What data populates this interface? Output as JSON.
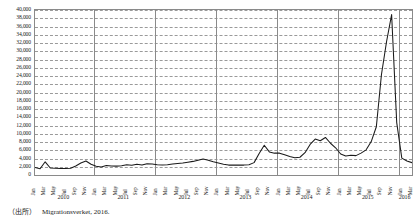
{
  "chart_data": {
    "type": "line",
    "title": "",
    "subtitle": "",
    "xlabel": "",
    "ylabel": "",
    "ylim": [
      0,
      40000
    ],
    "ytick_step": 2000,
    "yticks": [
      "0",
      "2,000",
      "4,000",
      "6,000",
      "8,000",
      "10,000",
      "12,000",
      "14,000",
      "16,000",
      "18,000",
      "20,000",
      "22,000",
      "24,000",
      "26,000",
      "28,000",
      "30,000",
      "32,000",
      "34,000",
      "36,000",
      "38,000",
      "40,000"
    ],
    "grid": true,
    "legend": "none",
    "x_tick_months": [
      "Jan",
      "Mar",
      "May",
      "Jul",
      "Sep",
      "Nov"
    ],
    "years": [
      "2010",
      "2011",
      "2012",
      "2013",
      "2014",
      "2015",
      "2016"
    ],
    "months_per_year": [
      12,
      12,
      12,
      12,
      12,
      12,
      3
    ],
    "x": [
      "2010-01",
      "2010-02",
      "2010-03",
      "2010-04",
      "2010-05",
      "2010-06",
      "2010-07",
      "2010-08",
      "2010-09",
      "2010-10",
      "2010-11",
      "2010-12",
      "2011-01",
      "2011-02",
      "2011-03",
      "2011-04",
      "2011-05",
      "2011-06",
      "2011-07",
      "2011-08",
      "2011-09",
      "2011-10",
      "2011-11",
      "2011-12",
      "2012-01",
      "2012-02",
      "2012-03",
      "2012-04",
      "2012-05",
      "2012-06",
      "2012-07",
      "2012-08",
      "2012-09",
      "2012-10",
      "2012-11",
      "2012-12",
      "2013-01",
      "2013-02",
      "2013-03",
      "2013-04",
      "2013-05",
      "2013-06",
      "2013-07",
      "2013-08",
      "2013-09",
      "2013-10",
      "2013-11",
      "2013-12",
      "2014-01",
      "2014-02",
      "2014-03",
      "2014-04",
      "2014-05",
      "2014-06",
      "2014-07",
      "2014-08",
      "2014-09",
      "2014-10",
      "2014-11",
      "2014-12",
      "2015-01",
      "2015-02",
      "2015-03",
      "2015-04",
      "2015-05",
      "2015-06",
      "2015-07",
      "2015-08",
      "2015-09",
      "2015-10",
      "2015-11",
      "2015-12",
      "2016-01",
      "2016-02",
      "2016-03"
    ],
    "series": [
      {
        "name": "Asylum applications",
        "color": "#1a1a1a",
        "values": [
          1800,
          1500,
          3200,
          1700,
          1650,
          1600,
          1600,
          1650,
          2200,
          2900,
          3400,
          2600,
          2100,
          1950,
          2300,
          2200,
          2150,
          2250,
          2500,
          2350,
          2600,
          2400,
          2700,
          2650,
          2500,
          2400,
          2500,
          2650,
          2800,
          2900,
          3100,
          3300,
          3600,
          3900,
          3600,
          3200,
          2900,
          2600,
          2400,
          2400,
          2400,
          2400,
          2500,
          3000,
          5200,
          7200,
          5600,
          5300,
          5300,
          4900,
          4500,
          4200,
          4300,
          5400,
          7400,
          8700,
          8300,
          9100,
          7700,
          6600,
          5100,
          4600,
          4800,
          4700,
          5300,
          6100,
          8100,
          11700,
          24300,
          32300,
          38900,
          12700,
          4100,
          3400,
          3000
        ]
      }
    ],
    "peak": {
      "label": "2015-11",
      "value": 38900
    }
  },
  "source": {
    "paren": "（出所）",
    "text": "Migrationsverket, 2016."
  }
}
